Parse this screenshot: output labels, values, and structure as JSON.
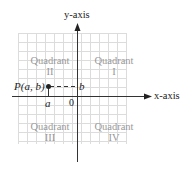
{
  "axes": {
    "y_label": "y-axis",
    "x_label": "x-axis",
    "origin_label": "0"
  },
  "point": {
    "label": "P(a, b)",
    "x_label": "a",
    "y_label": "b"
  },
  "quadrants": [
    {
      "name": "Quadrant",
      "numeral": "I"
    },
    {
      "name": "Quadrant",
      "numeral": "II"
    },
    {
      "name": "Quadrant",
      "numeral": "III"
    },
    {
      "name": "Quadrant",
      "numeral": "IV"
    }
  ],
  "colors": {
    "grid": "#d8d8d8",
    "axis": "#333333",
    "quadrant_text": "#999999"
  }
}
